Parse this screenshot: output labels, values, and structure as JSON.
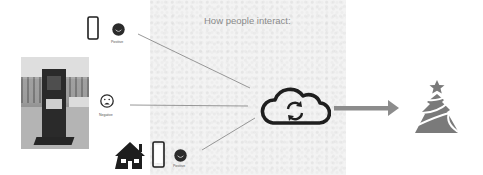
{
  "title": "How people interact:",
  "sources": [
    {
      "icons": [
        "smartphone-icon",
        "happy-face-icon"
      ],
      "label": "Positive"
    },
    {
      "icons": [
        "sad-face-icon"
      ],
      "label": "Negative"
    },
    {
      "icons": [
        "house-icon",
        "smartphone-icon",
        "happy-face-icon"
      ],
      "label": "Positive"
    }
  ],
  "hub": {
    "icon": "cloud-sync-icon"
  },
  "output": {
    "icon": "christmas-tree-icon"
  },
  "photo": {
    "subject": "outdoor interactive kiosk"
  },
  "colors": {
    "icon_dark": "#1e1e1e",
    "arrow": "#8c8c8c",
    "tree": "#7a7a7a",
    "title": "#8a8a8a"
  }
}
